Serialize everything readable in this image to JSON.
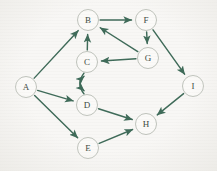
{
  "graph": {
    "title": "Directed graph with nine labeled nodes",
    "node_radius": 10.5,
    "colors": {
      "background": "#f8f7f5",
      "edge": "#3f6b59",
      "node_stroke": "#b9bdb5",
      "node_fill": "#fbfaf8",
      "label": "#3d4a42"
    },
    "nodes": [
      {
        "id": "A",
        "label": "A",
        "x": 26,
        "y": 87
      },
      {
        "id": "B",
        "label": "B",
        "x": 88,
        "y": 20
      },
      {
        "id": "C",
        "label": "C",
        "x": 87,
        "y": 62
      },
      {
        "id": "D",
        "label": "D",
        "x": 87,
        "y": 105
      },
      {
        "id": "E",
        "label": "E",
        "x": 88,
        "y": 148
      },
      {
        "id": "F",
        "label": "F",
        "x": 146,
        "y": 20
      },
      {
        "id": "G",
        "label": "G",
        "x": 148,
        "y": 58
      },
      {
        "id": "H",
        "label": "H",
        "x": 146,
        "y": 124
      },
      {
        "id": "I",
        "label": "I",
        "x": 193,
        "y": 86
      }
    ],
    "edges": [
      {
        "from": "A",
        "to": "B",
        "directed": true,
        "curve": "straight"
      },
      {
        "from": "A",
        "to": "D",
        "directed": true,
        "curve": "straight"
      },
      {
        "from": "A",
        "to": "E",
        "directed": true,
        "curve": "straight"
      },
      {
        "from": "B",
        "to": "F",
        "directed": true,
        "curve": "straight"
      },
      {
        "from": "C",
        "to": "B",
        "directed": true,
        "curve": "straight"
      },
      {
        "from": "C",
        "to": "D",
        "directed": true,
        "curve": "arc-right"
      },
      {
        "from": "D",
        "to": "C",
        "directed": true,
        "curve": "arc-left"
      },
      {
        "from": "D",
        "to": "H",
        "directed": true,
        "curve": "straight"
      },
      {
        "from": "E",
        "to": "H",
        "directed": true,
        "curve": "straight"
      },
      {
        "from": "F",
        "to": "G",
        "directed": true,
        "curve": "straight"
      },
      {
        "from": "F",
        "to": "I",
        "directed": true,
        "curve": "straight"
      },
      {
        "from": "G",
        "to": "B",
        "directed": true,
        "curve": "straight"
      },
      {
        "from": "G",
        "to": "C",
        "directed": true,
        "curve": "straight"
      },
      {
        "from": "I",
        "to": "H",
        "directed": true,
        "curve": "straight"
      }
    ]
  }
}
